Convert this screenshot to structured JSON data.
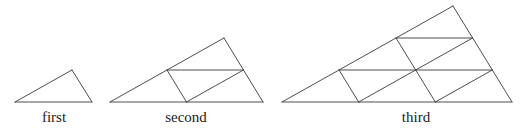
{
  "diagram": {
    "stroke_color": "#3a3a3a",
    "figures": [
      {
        "label": "first",
        "label_x": 54,
        "subdivisions": 1,
        "vertices": {
          "left": [
            15,
            102
          ],
          "apex": [
            72,
            70
          ],
          "right": [
            92,
            102
          ]
        }
      },
      {
        "label": "second",
        "label_x": 186,
        "subdivisions": 2,
        "vertices": {
          "left": [
            110,
            102
          ],
          "apex": [
            224,
            38
          ],
          "right": [
            263,
            102
          ]
        }
      },
      {
        "label": "third",
        "label_x": 416,
        "subdivisions": 3,
        "vertices": {
          "left": [
            282,
            102
          ],
          "apex": [
            453,
            6
          ],
          "right": [
            512,
            102
          ]
        }
      }
    ]
  }
}
